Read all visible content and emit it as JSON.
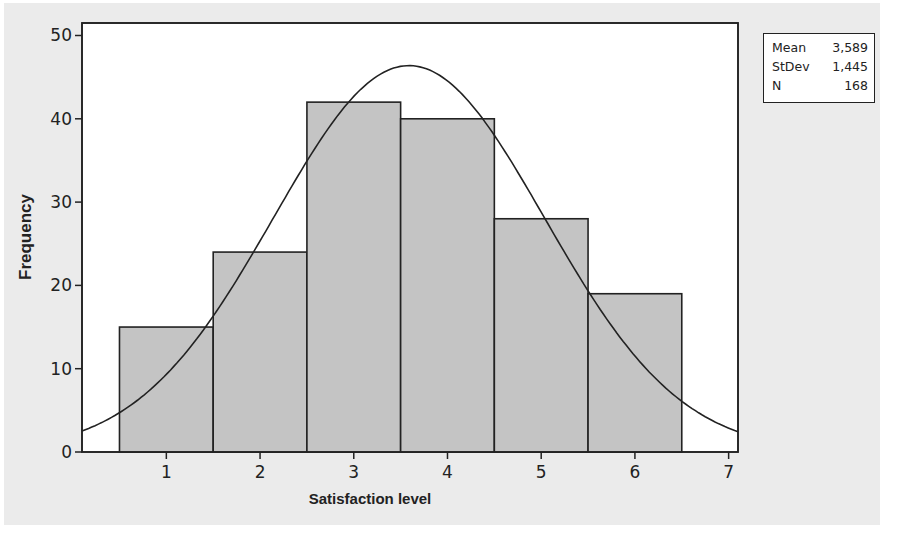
{
  "chart_data": {
    "type": "bar",
    "subtype": "histogram-with-normal-fit",
    "title": "",
    "xlabel": "Satisfaction level",
    "ylabel": "Frequency",
    "categories": [
      "1",
      "2",
      "3",
      "4",
      "5",
      "6"
    ],
    "bin_centers": [
      1,
      2,
      3,
      4,
      5,
      6
    ],
    "bin_width": 1,
    "values": [
      15,
      24,
      42,
      40,
      28,
      19
    ],
    "xlim": [
      0.1,
      7.1
    ],
    "ylim": [
      0,
      51.5
    ],
    "xticks": [
      1,
      2,
      3,
      4,
      5,
      6,
      7
    ],
    "yticks": [
      0,
      10,
      20,
      30,
      40,
      50
    ],
    "grid": false,
    "fit_curve": {
      "type": "normal",
      "mean": 3.589,
      "stdev": 1.445,
      "n": 168
    },
    "legend": {
      "position": "top-right-outside",
      "rows": [
        {
          "label": "Mean",
          "value": "3,589"
        },
        {
          "label": "StDev",
          "value": "1,445"
        },
        {
          "label": "N",
          "value": "168"
        }
      ]
    },
    "colors": {
      "bar_fill": "#c4c4c4",
      "bar_edge": "#222222",
      "curve": "#222222",
      "panel_bg": "#ebebeb",
      "plot_bg": "#ffffff"
    }
  }
}
